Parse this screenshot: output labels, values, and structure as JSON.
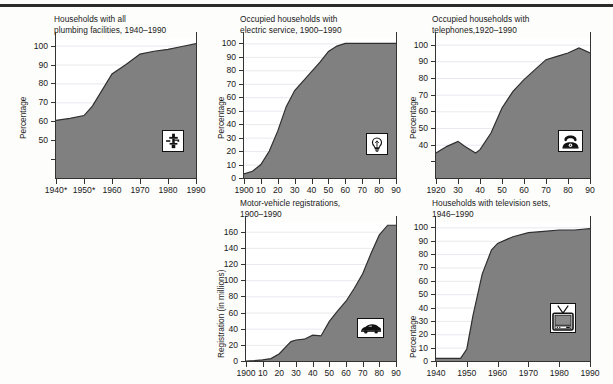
{
  "page": {
    "kind": "figure-grid-of-area-charts",
    "panel_count": 5,
    "divider": "top-rule"
  },
  "colors": {
    "area_fill": "#808080",
    "area_line": "#2f2f2f",
    "axis": "#333333",
    "gridline": "#e9e9ef",
    "plot_bg": "#ffffff",
    "page_bg": "#fdfdfb",
    "text": "#1a1a1a",
    "rule": "#2b2b2b"
  },
  "chart_data": [
    {
      "id": "plumbing",
      "type": "area",
      "title": "Households with all\nplumbing facilities, 1940–1990",
      "xlabel": "",
      "ylabel": "Percentage",
      "icon": "faucet-icon",
      "xticklabels": [
        "1940*",
        "1950*",
        "1960",
        "1970",
        "1980",
        "1990"
      ],
      "xtickvalues": [
        1940,
        1950,
        1960,
        1970,
        1980,
        1990
      ],
      "yticklabels": [
        "50",
        "60",
        "70",
        "80",
        "90",
        "100"
      ],
      "ytickvalues": [
        50,
        60,
        70,
        80,
        90,
        100
      ],
      "xlim": [
        1940,
        1990
      ],
      "ylim": [
        30,
        104
      ],
      "grid": true,
      "x": [
        1940,
        1945,
        1950,
        1953,
        1960,
        1965,
        1970,
        1975,
        1980,
        1985,
        1990
      ],
      "values": [
        60.5,
        61.5,
        63.0,
        68.0,
        85.0,
        90.0,
        95.5,
        97.0,
        98.0,
        99.5,
        101.0
      ],
      "footnote": "*"
    },
    {
      "id": "electric",
      "type": "area",
      "title": "Occupied households with\nelectric service, 1900–1990",
      "xlabel": "",
      "ylabel": "Percentage",
      "icon": "lightbulb-icon",
      "xticklabels": [
        "1900",
        "10",
        "20",
        "30",
        "40",
        "50",
        "60",
        "70",
        "80",
        "90"
      ],
      "xtickvalues": [
        1900,
        1910,
        1920,
        1930,
        1940,
        1950,
        1960,
        1970,
        1980,
        1990
      ],
      "yticklabels": [
        "0",
        "10",
        "20",
        "30",
        "40",
        "50",
        "60",
        "70",
        "80",
        "90",
        "100"
      ],
      "ytickvalues": [
        0,
        10,
        20,
        30,
        40,
        50,
        60,
        70,
        80,
        90,
        100
      ],
      "xlim": [
        1900,
        1990
      ],
      "ylim": [
        0,
        104
      ],
      "grid": true,
      "x": [
        1900,
        1905,
        1910,
        1915,
        1920,
        1925,
        1930,
        1935,
        1940,
        1945,
        1950,
        1955,
        1960,
        1970,
        1980,
        1990
      ],
      "values": [
        3,
        5,
        10,
        20,
        35,
        53,
        65,
        72,
        79,
        86,
        94,
        98,
        100,
        100,
        100,
        100
      ]
    },
    {
      "id": "telephones",
      "type": "area",
      "title": "Occupied households with\ntelephones,1920–1990",
      "xlabel": "",
      "ylabel": "Percentage",
      "icon": "telephone-icon",
      "xticklabels": [
        "1920",
        "30",
        "40",
        "50",
        "60",
        "70",
        "80",
        "90"
      ],
      "xtickvalues": [
        1920,
        1930,
        1940,
        1950,
        1960,
        1970,
        1980,
        1990
      ],
      "yticklabels": [
        "40",
        "50",
        "60",
        "70",
        "80",
        "90",
        "100"
      ],
      "ytickvalues": [
        40,
        50,
        60,
        70,
        80,
        90,
        100
      ],
      "xlim": [
        1920,
        1990
      ],
      "ylim": [
        20,
        104
      ],
      "grid": true,
      "x": [
        1920,
        1925,
        1930,
        1933,
        1938,
        1940,
        1945,
        1950,
        1955,
        1960,
        1965,
        1970,
        1975,
        1980,
        1985,
        1990
      ],
      "values": [
        35,
        39,
        42,
        39,
        35,
        37,
        47,
        62,
        72,
        79,
        85,
        91,
        93,
        95,
        98,
        95
      ]
    },
    {
      "id": "motor-vehicles",
      "type": "area",
      "title": "Motor-vehicle registrations,\n1900–1990",
      "xlabel": "",
      "ylabel": "Registration (in millions)",
      "icon": "car-icon",
      "xticklabels": [
        "1900",
        "10",
        "20",
        "30",
        "40",
        "50",
        "60",
        "70",
        "80",
        "90"
      ],
      "xtickvalues": [
        1900,
        1910,
        1920,
        1930,
        1940,
        1950,
        1960,
        1970,
        1980,
        1990
      ],
      "yticklabels": [
        "0",
        "20",
        "40",
        "60",
        "80",
        "100",
        "120",
        "140",
        "160"
      ],
      "ytickvalues": [
        0,
        20,
        40,
        60,
        80,
        100,
        120,
        140,
        160
      ],
      "xlim": [
        1900,
        1990
      ],
      "ylim": [
        0,
        172
      ],
      "grid": true,
      "x": [
        1900,
        1905,
        1910,
        1915,
        1920,
        1925,
        1927,
        1930,
        1935,
        1940,
        1945,
        1950,
        1955,
        1960,
        1965,
        1970,
        1975,
        1980,
        1985,
        1990
      ],
      "values": [
        0,
        0.5,
        1.5,
        3,
        9,
        20,
        24,
        26,
        27,
        32,
        31,
        49,
        62,
        74,
        90,
        108,
        133,
        156,
        168,
        168
      ]
    },
    {
      "id": "television",
      "type": "area",
      "title": "Households with television sets,\n1946–1990",
      "xlabel": "",
      "ylabel": "Percentage",
      "icon": "television-icon",
      "xticklabels": [
        "1940",
        "1950",
        "1960",
        "1970",
        "1980",
        "1990"
      ],
      "xtickvalues": [
        1940,
        1950,
        1960,
        1970,
        1980,
        1990
      ],
      "yticklabels": [
        "0",
        "10",
        "20",
        "30",
        "40",
        "50",
        "60",
        "70",
        "80",
        "90",
        "100"
      ],
      "ytickvalues": [
        0,
        10,
        20,
        30,
        40,
        50,
        60,
        70,
        80,
        90,
        100
      ],
      "xlim": [
        1940,
        1990
      ],
      "ylim": [
        0,
        104
      ],
      "grid": true,
      "x": [
        1940,
        1946,
        1948,
        1950,
        1952,
        1955,
        1958,
        1960,
        1965,
        1970,
        1975,
        1980,
        1985,
        1990
      ],
      "values": [
        2,
        2,
        2,
        9,
        34,
        65,
        83,
        88,
        93,
        96,
        97,
        98,
        98,
        99
      ]
    }
  ]
}
